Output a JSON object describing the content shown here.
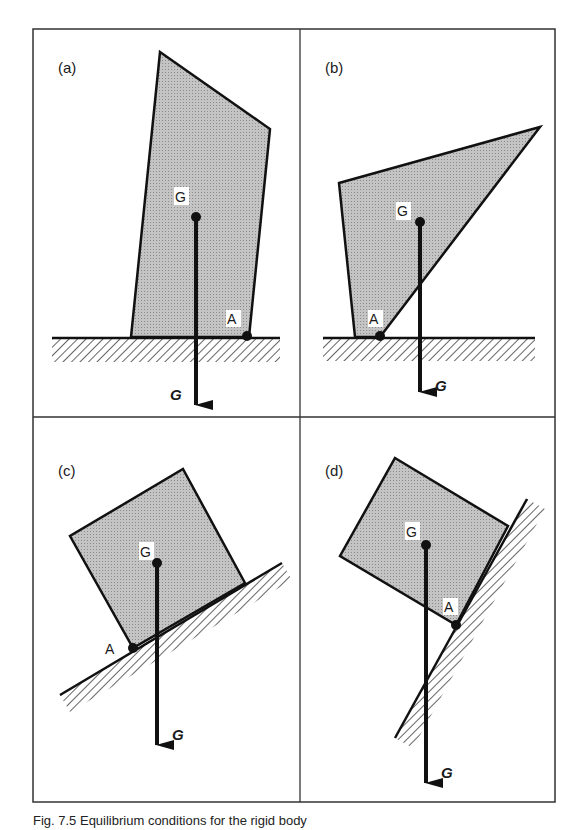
{
  "figure": {
    "caption": "Fig. 7.5  Equilibrium conditions for the rigid body",
    "frame_color": "#333333",
    "body_fill": "#b8b8b8",
    "line_color": "#111111",
    "panels": [
      {
        "id": "a",
        "label": "(a)",
        "point_g": "G",
        "point_a": "A",
        "force": "G",
        "support": "horizontal ground"
      },
      {
        "id": "b",
        "label": "(b)",
        "point_g": "G",
        "point_a": "A",
        "force": "G",
        "support": "horizontal ground"
      },
      {
        "id": "c",
        "label": "(c)",
        "point_g": "G",
        "point_a": "A",
        "force": "G",
        "support": "inclined plane"
      },
      {
        "id": "d",
        "label": "(d)",
        "point_g": "G",
        "point_a": "A",
        "force": "G",
        "support": "steep inclined wall"
      }
    ]
  }
}
